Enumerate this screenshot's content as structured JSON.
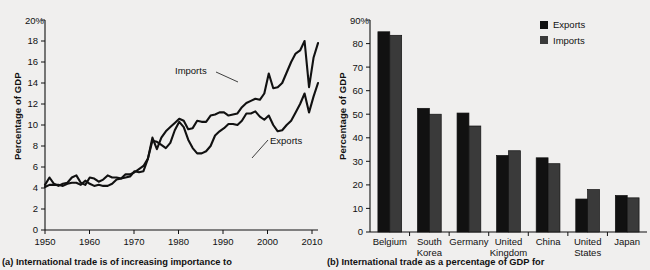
{
  "figure": {
    "background": "#f0efee",
    "ink": "#111111"
  },
  "panel_a": {
    "caption": "(a) International trade is of increasing importance to",
    "annotations": {
      "imports": "Imports",
      "exports": "Exports"
    }
  },
  "panel_b": {
    "caption": "(b) International trade as a percentage of GDP for",
    "legend": {
      "position": "top-right",
      "entries": [
        {
          "label": "Exports",
          "color": "#111111"
        },
        {
          "label": "Imports",
          "color": "#3a3a3a"
        }
      ]
    }
  },
  "chart_data": [
    {
      "type": "line",
      "panel": "a",
      "title": "",
      "xlabel": "",
      "ylabel": "Percentage of GDP",
      "xlim": [
        1950,
        2011
      ],
      "ylim": [
        0,
        20
      ],
      "ytick_labels": [
        "0",
        "2",
        "4",
        "6",
        "8",
        "10",
        "12",
        "14",
        "16",
        "18",
        "20%"
      ],
      "yticks": [
        0,
        2,
        4,
        6,
        8,
        10,
        12,
        14,
        16,
        18,
        20
      ],
      "xticks": [
        1950,
        1960,
        1970,
        1980,
        1990,
        2000,
        2010
      ],
      "xtick_labels": [
        "1950",
        "1960",
        "1970",
        "1980",
        "1990",
        "2000",
        "2010"
      ],
      "grid": false,
      "legend": "inline-annotations",
      "x": [
        1950,
        1951,
        1952,
        1953,
        1954,
        1955,
        1956,
        1957,
        1958,
        1959,
        1960,
        1961,
        1962,
        1963,
        1964,
        1965,
        1966,
        1967,
        1968,
        1969,
        1970,
        1971,
        1972,
        1973,
        1974,
        1975,
        1976,
        1977,
        1978,
        1979,
        1980,
        1981,
        1982,
        1983,
        1984,
        1985,
        1986,
        1987,
        1988,
        1989,
        1990,
        1991,
        1992,
        1993,
        1994,
        1995,
        1996,
        1997,
        1998,
        1999,
        2000,
        2001,
        2002,
        2003,
        2004,
        2005,
        2006,
        2007,
        2008,
        2009,
        2010,
        2011
      ],
      "series": [
        {
          "name": "Exports",
          "values": [
            4.3,
            5.0,
            4.4,
            4.2,
            4.4,
            4.5,
            5.0,
            5.2,
            4.5,
            4.3,
            5.0,
            4.9,
            4.6,
            4.8,
            5.2,
            5.0,
            5.0,
            4.9,
            5.0,
            5.1,
            5.6,
            5.5,
            5.6,
            6.8,
            8.5,
            8.4,
            8.1,
            7.8,
            8.3,
            9.5,
            10.3,
            9.8,
            8.6,
            7.8,
            7.3,
            7.3,
            7.5,
            8.0,
            9.0,
            9.4,
            9.7,
            10.1,
            10.1,
            10.0,
            10.4,
            11.1,
            11.1,
            11.3,
            10.8,
            10.5,
            10.9,
            10.0,
            9.4,
            9.5,
            10.0,
            10.4,
            11.2,
            12.0,
            13.0,
            11.2,
            12.7,
            14.0
          ]
        },
        {
          "name": "Imports",
          "values": [
            4.1,
            4.3,
            4.3,
            4.3,
            4.2,
            4.4,
            4.5,
            4.5,
            4.3,
            4.7,
            4.4,
            4.2,
            4.3,
            4.2,
            4.2,
            4.4,
            4.8,
            4.9,
            5.3,
            5.3,
            5.5,
            5.8,
            6.1,
            6.8,
            8.8,
            7.7,
            8.8,
            9.4,
            9.8,
            10.2,
            10.6,
            10.4,
            9.6,
            9.7,
            10.4,
            10.3,
            10.3,
            10.9,
            11.0,
            11.2,
            11.2,
            10.9,
            11.0,
            11.1,
            11.7,
            12.1,
            12.3,
            12.5,
            12.4,
            13.0,
            14.9,
            13.5,
            13.6,
            14.0,
            15.0,
            16.0,
            16.8,
            17.1,
            18.0,
            13.6,
            16.4,
            17.8
          ]
        }
      ]
    },
    {
      "type": "bar",
      "panel": "b",
      "title": "",
      "xlabel": "",
      "ylabel": "Percentage of GDP",
      "ylim": [
        0,
        90
      ],
      "yticks": [
        0,
        10,
        20,
        30,
        40,
        50,
        60,
        70,
        80,
        90
      ],
      "ytick_labels": [
        "0",
        "10",
        "20",
        "30",
        "40",
        "50",
        "60",
        "70",
        "80",
        "90%"
      ],
      "grid": false,
      "categories": [
        "Belgium",
        "South Korea",
        "Germany",
        "United Kingdom",
        "China",
        "United States",
        "Japan"
      ],
      "category_lines": [
        [
          "Belgium"
        ],
        [
          "South",
          "Korea"
        ],
        [
          "Germany"
        ],
        [
          "United",
          "Kingdom"
        ],
        [
          "China"
        ],
        [
          "United",
          "States"
        ],
        [
          "Japan"
        ]
      ],
      "series": [
        {
          "name": "Exports",
          "color": "#111111",
          "values": [
            85.0,
            52.5,
            50.5,
            32.5,
            31.5,
            14.0,
            15.5
          ]
        },
        {
          "name": "Imports",
          "color": "#3a3a3a",
          "values": [
            83.5,
            50.0,
            45.0,
            34.5,
            29.0,
            18.0,
            14.5
          ]
        }
      ]
    }
  ]
}
